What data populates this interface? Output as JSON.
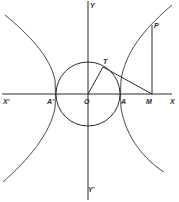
{
  "diagram": {
    "title": "",
    "type": "geometry",
    "colors": {
      "stroke": "#2a2a2a",
      "background": "#ffffff"
    },
    "labels": {
      "Y": "Y",
      "Y_prime": "Y'",
      "X": "X",
      "X_prime": "X'",
      "O": "O",
      "A": "A",
      "A_prime": "A'",
      "M": "M",
      "T": "T",
      "P": "P"
    },
    "elements": [
      "x-axis X'X",
      "y-axis Y'Y",
      "auxiliary circle centered at O through A and A'",
      "hyperbola right branch through A and P",
      "hyperbola left branch through A'",
      "segment OT",
      "tangent segment TM",
      "ordinate MP"
    ]
  }
}
